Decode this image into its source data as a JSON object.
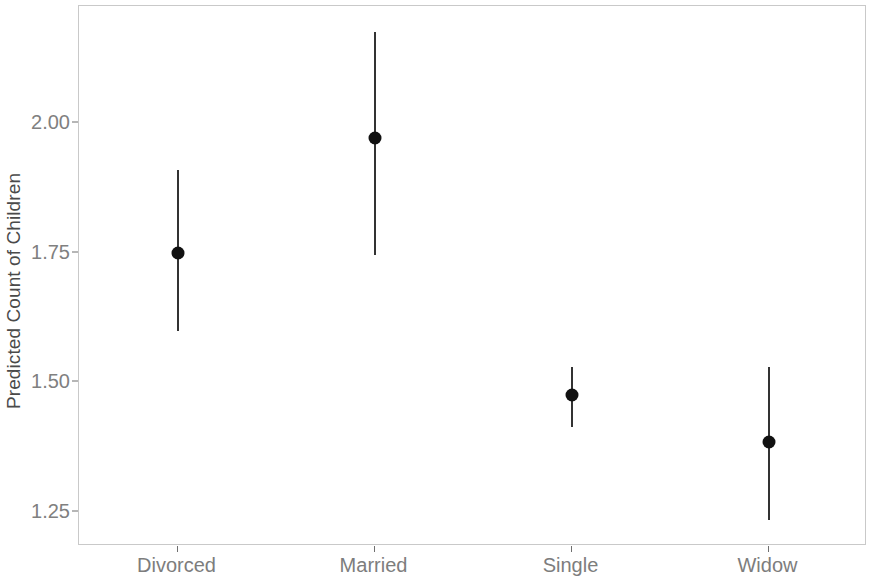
{
  "chart_data": {
    "type": "scatter",
    "title": "",
    "subtitle": "",
    "xlabel": "",
    "ylabel": "Predicted Count of Children",
    "categories": [
      "Divorced",
      "Married",
      "Single",
      "Widow"
    ],
    "values": [
      1.75,
      1.97,
      1.475,
      1.385
    ],
    "error_low": [
      1.6,
      1.745,
      1.415,
      1.235
    ],
    "error_high": [
      1.91,
      2.175,
      1.53,
      1.53
    ],
    "series": [
      {
        "name": "Predicted Count of Children",
        "points": [
          {
            "category": "Divorced",
            "estimate": 1.75,
            "ci_low": 1.6,
            "ci_high": 1.91
          },
          {
            "category": "Married",
            "estimate": 1.97,
            "ci_low": 1.745,
            "ci_high": 2.175
          },
          {
            "category": "Single",
            "estimate": 1.475,
            "ci_low": 1.415,
            "ci_high": 1.53
          },
          {
            "category": "Widow",
            "estimate": 1.385,
            "ci_low": 1.235,
            "ci_high": 1.53
          }
        ]
      }
    ],
    "ytick_labels": [
      "2.00",
      "1.75",
      "1.50",
      "1.25"
    ],
    "ytick_values": [
      2.0,
      1.75,
      1.5,
      1.25
    ],
    "ylim": [
      1.185,
      2.225
    ],
    "grid": false,
    "legend": "none",
    "marker_color": "#111111",
    "errorbar_color": "#333333",
    "panel_border_color": "#c9c9c9",
    "axis_text_color": "#808080",
    "background_color": "#ffffff"
  }
}
